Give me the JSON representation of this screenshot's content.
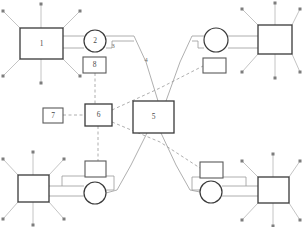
{
  "diagram": {
    "canvas": {
      "width": 303,
      "height": 227
    },
    "background_color": "#ffffff",
    "stroke_color": "#3a3a3a",
    "link_color": "#9a9a9a",
    "ray_color": "#b0b0b0",
    "nodes": [
      {
        "id": "node-1",
        "label": "1",
        "shape": "rect",
        "x": 20,
        "y": 28,
        "width": 43,
        "height": 31,
        "has_rays": true,
        "ray_count": 8
      },
      {
        "id": "node-2",
        "label": "2",
        "shape": "circle",
        "cx": 95,
        "cy": 41,
        "r": 11,
        "has_rays": false
      },
      {
        "id": "node-5",
        "label": "5",
        "shape": "rect",
        "x": 133,
        "y": 101,
        "width": 41,
        "height": 32,
        "has_rays": false
      },
      {
        "id": "node-6",
        "label": "6",
        "shape": "rect",
        "x": 85,
        "y": 104,
        "width": 27,
        "height": 22,
        "has_rays": false
      },
      {
        "id": "node-7",
        "label": "7",
        "shape": "rect",
        "x": 43,
        "y": 108,
        "width": 20,
        "height": 15,
        "has_rays": false
      },
      {
        "id": "node-8",
        "label": "8",
        "shape": "rect",
        "x": 83,
        "y": 57,
        "width": 23,
        "height": 16,
        "has_rays": false
      },
      {
        "id": "node-tr-circle",
        "label": "",
        "shape": "circle",
        "cx": 216,
        "cy": 40,
        "r": 12,
        "has_rays": false
      },
      {
        "id": "node-tr-box",
        "label": "",
        "shape": "rect",
        "x": 258,
        "y": 25,
        "width": 34,
        "height": 29,
        "has_rays": true,
        "ray_count": 8
      },
      {
        "id": "node-tr-small",
        "label": "",
        "shape": "rect",
        "x": 203,
        "y": 58,
        "width": 23,
        "height": 15,
        "has_rays": false
      },
      {
        "id": "node-bl-box",
        "label": "",
        "shape": "rect",
        "x": 18,
        "y": 175,
        "width": 31,
        "height": 27,
        "has_rays": true,
        "ray_count": 8
      },
      {
        "id": "node-bl-circle",
        "label": "",
        "shape": "circle",
        "cx": 95,
        "cy": 193,
        "r": 11,
        "has_rays": false
      },
      {
        "id": "node-bl-small",
        "label": "",
        "shape": "rect",
        "x": 85,
        "y": 161,
        "width": 21,
        "height": 16,
        "has_rays": false
      },
      {
        "id": "node-br-box",
        "label": "",
        "shape": "rect",
        "x": 258,
        "y": 177,
        "width": 31,
        "height": 26,
        "has_rays": true,
        "ray_count": 8
      },
      {
        "id": "node-br-circle",
        "label": "",
        "shape": "circle",
        "cx": 211,
        "cy": 192,
        "r": 11,
        "has_rays": false
      },
      {
        "id": "node-br-small",
        "label": "",
        "shape": "rect",
        "x": 200,
        "y": 162,
        "width": 23,
        "height": 16,
        "has_rays": false
      }
    ],
    "edge_labels": [
      {
        "id": "edge-label-3",
        "label": "3",
        "x": 113,
        "y": 47
      },
      {
        "id": "edge-label-4",
        "label": "4",
        "x": 146,
        "y": 61
      }
    ],
    "links": [
      {
        "id": "link-1-2-upper",
        "style": "solid",
        "from": "node-1",
        "to": "node-2"
      },
      {
        "id": "link-1-2-lower",
        "style": "solid",
        "from": "node-1",
        "to": "node-2"
      },
      {
        "id": "link-2-3-bus",
        "style": "solid",
        "from": "node-2",
        "to": "node-5"
      },
      {
        "id": "link-8-6",
        "style": "dashed",
        "from": "node-8",
        "to": "node-6"
      },
      {
        "id": "link-7-6",
        "style": "dashed",
        "from": "node-7",
        "to": "node-6"
      },
      {
        "id": "link-6-trsmall",
        "style": "dashed",
        "from": "node-6",
        "to": "node-tr-small"
      },
      {
        "id": "link-6-brsmall",
        "style": "dashed",
        "from": "node-6",
        "to": "node-br-small"
      },
      {
        "id": "link-5-crossing-left",
        "style": "solid",
        "from": "node-5",
        "to": "node-bl-circle"
      },
      {
        "id": "link-5-crossing-right",
        "style": "solid",
        "from": "node-5",
        "to": "node-br-circle"
      },
      {
        "id": "link-trcircle-trbox",
        "style": "solid",
        "from": "node-tr-circle",
        "to": "node-tr-box"
      },
      {
        "id": "link-blbox-blcircle",
        "style": "solid",
        "from": "node-bl-box",
        "to": "node-bl-circle"
      },
      {
        "id": "link-brcircle-brbox",
        "style": "solid",
        "from": "node-br-circle",
        "to": "node-br-box"
      }
    ]
  }
}
